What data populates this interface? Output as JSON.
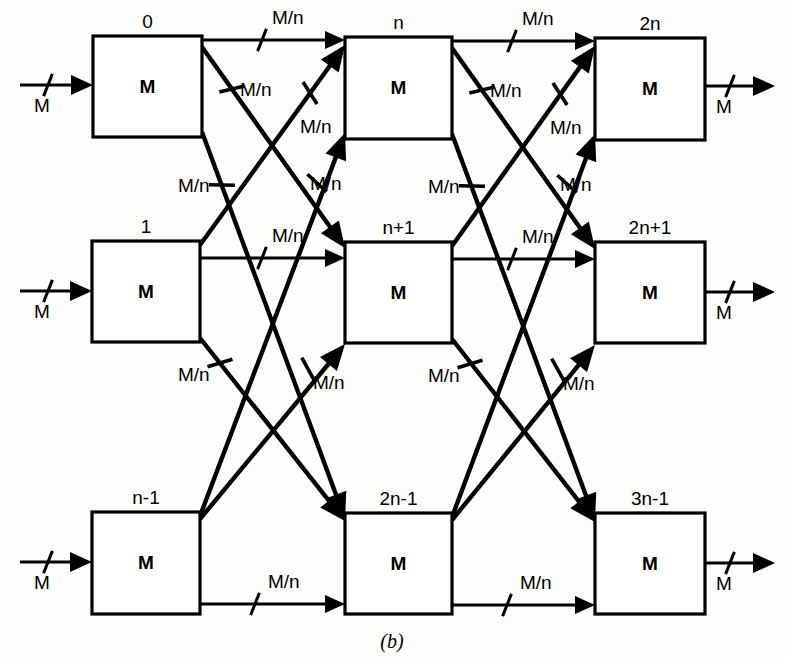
{
  "figure": {
    "caption": "(b)",
    "caption_x": 392,
    "caption_y": 648,
    "background": "#fdfdfb",
    "ink_color": "#000000"
  },
  "nodes": [
    {
      "id": "r0c0",
      "label": "M",
      "number": "0",
      "x": 93,
      "y": 36,
      "w": 109,
      "h": 101
    },
    {
      "id": "r0c1",
      "label": "M",
      "number": "n",
      "x": 345,
      "y": 37,
      "w": 107,
      "h": 102
    },
    {
      "id": "r0c2",
      "label": "M",
      "number": "2n",
      "x": 595,
      "y": 38,
      "w": 110,
      "h": 102
    },
    {
      "id": "r1c0",
      "label": "M",
      "number": "1",
      "x": 92,
      "y": 241,
      "w": 108,
      "h": 101
    },
    {
      "id": "r1c1",
      "label": "M",
      "number": "n+1",
      "x": 345,
      "y": 242,
      "w": 107,
      "h": 101
    },
    {
      "id": "r1c2",
      "label": "M",
      "number": "2n+1",
      "x": 595,
      "y": 242,
      "w": 110,
      "h": 101
    },
    {
      "id": "r2c0",
      "label": "M",
      "number": "n-1",
      "x": 92,
      "y": 512,
      "w": 108,
      "h": 102
    },
    {
      "id": "r2c1",
      "label": "M",
      "number": "2n-1",
      "x": 345,
      "y": 513,
      "w": 107,
      "h": 101
    },
    {
      "id": "r2c2",
      "label": "M",
      "number": "3n-1",
      "x": 595,
      "y": 513,
      "w": 110,
      "h": 101
    }
  ],
  "io": {
    "input_label": "M",
    "output_label": "M",
    "inputs": [
      {
        "id": "in-row-0",
        "x1": 20,
        "y": 85,
        "x2": 93,
        "tick_x": 48,
        "label_x": 42,
        "label_y": 112
      },
      {
        "id": "in-row-1",
        "x1": 20,
        "y": 291,
        "x2": 92,
        "tick_x": 48,
        "label_x": 42,
        "label_y": 318
      },
      {
        "id": "in-row-2",
        "x1": 20,
        "y": 562,
        "x2": 92,
        "tick_x": 48,
        "label_x": 42,
        "label_y": 589
      }
    ],
    "outputs": [
      {
        "id": "out-row-0",
        "x1": 705,
        "y": 86,
        "x2": 775,
        "tick_x": 730,
        "label_x": 724,
        "label_y": 113
      },
      {
        "id": "out-row-1",
        "x1": 705,
        "y": 292,
        "x2": 775,
        "tick_x": 730,
        "label_x": 724,
        "label_y": 319
      },
      {
        "id": "out-row-2",
        "x1": 705,
        "y": 563,
        "x2": 775,
        "tick_x": 730,
        "label_x": 724,
        "label_y": 590
      }
    ]
  },
  "edge_label_text": "M/n",
  "edges": [
    {
      "id": "e-r0c0-r0c1",
      "kind": "straight",
      "x1": 202,
      "y1": 40,
      "x2": 345,
      "y2": 40,
      "tick_x": 262,
      "tick_y": 40,
      "label_x": 272,
      "label_y": 24
    },
    {
      "id": "e-r0c0-r1c1",
      "kind": "diagonal",
      "x1": 202,
      "y1": 47,
      "x2": 345,
      "y2": 248,
      "tick_x": 232,
      "tick_y": 89,
      "label_x": 240,
      "label_y": 96
    },
    {
      "id": "e-r0c0-r2c1",
      "kind": "diagonal",
      "x1": 202,
      "y1": 132,
      "x2": 345,
      "y2": 519,
      "tick_x": 222,
      "tick_y": 185,
      "label_x": 178,
      "label_y": 192
    },
    {
      "id": "e-r1c0-r0c1",
      "kind": "diagonal",
      "x1": 200,
      "y1": 245,
      "x2": 345,
      "y2": 45,
      "tick_x": 310,
      "tick_y": 93,
      "label_x": 300,
      "label_y": 133
    },
    {
      "id": "e-r1c0-r1c1",
      "kind": "straight",
      "x1": 200,
      "y1": 258,
      "x2": 345,
      "y2": 258,
      "tick_x": 262,
      "tick_y": 258,
      "label_x": 272,
      "label_y": 242
    },
    {
      "id": "e-r1c0-r2c1",
      "kind": "diagonal",
      "x1": 200,
      "y1": 338,
      "x2": 345,
      "y2": 521,
      "tick_x": 220,
      "tick_y": 363,
      "label_x": 178,
      "label_y": 381
    },
    {
      "id": "e-r2c0-r0c1",
      "kind": "diagonal",
      "x1": 200,
      "y1": 516,
      "x2": 345,
      "y2": 133,
      "tick_x": 317,
      "tick_y": 183,
      "label_x": 310,
      "label_y": 190
    },
    {
      "id": "e-r2c0-r1c1",
      "kind": "diagonal",
      "x1": 200,
      "y1": 519,
      "x2": 345,
      "y2": 344,
      "tick_x": 308,
      "tick_y": 369,
      "label_x": 313,
      "label_y": 389
    },
    {
      "id": "e-r2c0-r2c1",
      "kind": "straight",
      "x1": 200,
      "y1": 604,
      "x2": 345,
      "y2": 604,
      "tick_x": 255,
      "tick_y": 604,
      "label_x": 268,
      "label_y": 588
    },
    {
      "id": "e-r0c1-r0c2",
      "kind": "straight",
      "x1": 452,
      "y1": 41,
      "x2": 595,
      "y2": 41,
      "tick_x": 512,
      "tick_y": 41,
      "label_x": 522,
      "label_y": 25
    },
    {
      "id": "e-r0c1-r1c2",
      "kind": "diagonal",
      "x1": 452,
      "y1": 48,
      "x2": 595,
      "y2": 249,
      "tick_x": 482,
      "tick_y": 90,
      "label_x": 490,
      "label_y": 97
    },
    {
      "id": "e-r0c1-r2c2",
      "kind": "diagonal",
      "x1": 452,
      "y1": 134,
      "x2": 595,
      "y2": 520,
      "tick_x": 472,
      "tick_y": 186,
      "label_x": 428,
      "label_y": 193
    },
    {
      "id": "e-r1c1-r0c2",
      "kind": "diagonal",
      "x1": 452,
      "y1": 246,
      "x2": 595,
      "y2": 46,
      "tick_x": 560,
      "tick_y": 94,
      "label_x": 550,
      "label_y": 134
    },
    {
      "id": "e-r1c1-r1c2",
      "kind": "straight",
      "x1": 452,
      "y1": 259,
      "x2": 595,
      "y2": 259,
      "tick_x": 512,
      "tick_y": 259,
      "label_x": 522,
      "label_y": 243
    },
    {
      "id": "e-r1c1-r2c2",
      "kind": "diagonal",
      "x1": 452,
      "y1": 339,
      "x2": 595,
      "y2": 522,
      "tick_x": 470,
      "tick_y": 364,
      "label_x": 428,
      "label_y": 382
    },
    {
      "id": "e-r2c1-r0c2",
      "kind": "diagonal",
      "x1": 452,
      "y1": 517,
      "x2": 595,
      "y2": 134,
      "tick_x": 567,
      "tick_y": 184,
      "label_x": 560,
      "label_y": 191
    },
    {
      "id": "e-r2c1-r1c2",
      "kind": "diagonal",
      "x1": 452,
      "y1": 520,
      "x2": 595,
      "y2": 345,
      "tick_x": 558,
      "tick_y": 370,
      "label_x": 563,
      "label_y": 390
    },
    {
      "id": "e-r2c1-r2c2",
      "kind": "straight",
      "x1": 452,
      "y1": 605,
      "x2": 595,
      "y2": 605,
      "tick_x": 507,
      "tick_y": 605,
      "label_x": 520,
      "label_y": 589
    }
  ]
}
